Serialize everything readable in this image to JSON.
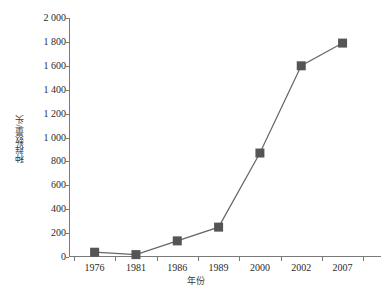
{
  "chart_data": {
    "type": "line",
    "title": "",
    "subtitle": "",
    "xlabel": "年份",
    "ylabel": "种群数量/头",
    "categories": [
      "1976",
      "1981",
      "1986",
      "1989",
      "2000",
      "2002",
      "2007"
    ],
    "values": [
      40,
      20,
      135,
      250,
      870,
      1600,
      1790
    ],
    "series": [
      {
        "name": "种群数量",
        "values": [
          40,
          20,
          135,
          250,
          870,
          1600,
          1790
        ],
        "marker": "square",
        "color": "#555555"
      }
    ],
    "ylim": [
      0,
      2000
    ],
    "ytick_step": 200,
    "ytick_labels": [
      "0",
      "200",
      "400",
      "600",
      "800",
      "1 000",
      "1 200",
      "1 400",
      "1 600",
      "1 800",
      "2 000"
    ],
    "ytick_values": [
      0,
      200,
      400,
      600,
      800,
      1000,
      1200,
      1400,
      1600,
      1800,
      2000
    ],
    "xtick_labels": [
      "1976",
      "1981",
      "1986",
      "1989",
      "2000",
      "2002",
      "2007"
    ],
    "grid": false,
    "legend": false,
    "legend_position": "none",
    "line_color": "#666666",
    "marker_color": "#555555",
    "axis_color": "#7a7a7a",
    "background_color": "#ffffff"
  }
}
